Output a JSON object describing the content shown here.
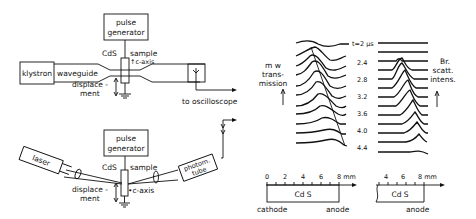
{
  "top_setup": {
    "pulse_generator": [
      "pulse",
      "generator"
    ],
    "cds_label": "CdS",
    "sample_label": "sample",
    "c_axis_label": "↑c-axis",
    "klystron_label": "klystron",
    "waveguide_label": "waveguide",
    "displacement_label": [
      "displace -",
      "ment"
    ],
    "oscilloscope_label": "to oscilloscope"
  },
  "bottom_setup": {
    "pulse_generator": [
      "pulse",
      "generator"
    ],
    "cds_label": "CdS",
    "sample_label": "sample",
    "c_axis_label": "•c-axis",
    "laser_label": "laser",
    "photom_label": [
      "photom.",
      "tube"
    ],
    "displacement_label": [
      "displace -",
      "ment"
    ]
  },
  "mw_panel": {
    "ylabel": [
      "m w",
      "trans-",
      "mission"
    ],
    "time_labels": [
      "t=2 µs",
      "2.4",
      "2.8",
      "3.2",
      "3.6",
      "4.0",
      "4.4"
    ],
    "scale_ticks": [
      "0",
      "2",
      "4",
      "6",
      "8 mm"
    ],
    "sample_label": "Cd S",
    "cathode_label": "cathode",
    "anode_label": "anode"
  },
  "br_panel": {
    "ylabel": [
      "Br.",
      "scatt.",
      "intens."
    ],
    "scale_ticks": [
      "4",
      "6",
      "8 mm"
    ],
    "sample_label": "Cd S",
    "anode_label": "anode"
  }
}
